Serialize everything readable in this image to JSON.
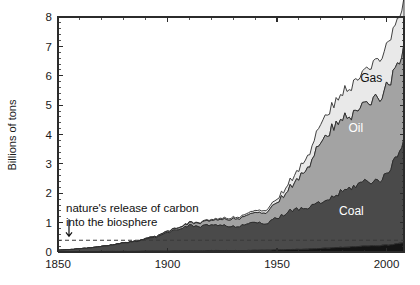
{
  "chart_data": {
    "type": "area",
    "stacked": true,
    "title": "",
    "subtitle": "",
    "xlabel": "",
    "ylabel": "Billions of tons",
    "xlim": [
      1850,
      2008
    ],
    "ylim": [
      0,
      8
    ],
    "grid": false,
    "legend_position": "inline-labels",
    "x_ticks_major": [
      1850,
      1900,
      1950,
      2000
    ],
    "x_tick_labels": [
      "1850",
      "1900",
      "1950",
      "2000"
    ],
    "x_tick_minor_step": 10,
    "y_ticks_major": [
      0,
      1,
      2,
      3,
      4,
      5,
      6,
      7,
      8
    ],
    "y_tick_labels": [
      "0",
      "1",
      "2",
      "3",
      "4",
      "5",
      "6",
      "7",
      "8"
    ],
    "y_tick_minor_step": 0.2,
    "colors": {
      "other": "#141414",
      "coal": "#4a4a4a",
      "oil": "#a3a3a3",
      "gas": "#e9e9e9",
      "outline": "#2b2b2b",
      "axis": "#2b2b2b",
      "nature_line": "#3a3a3a",
      "background": "#ffffff"
    },
    "x": [
      1850,
      1855,
      1860,
      1865,
      1870,
      1875,
      1880,
      1885,
      1890,
      1895,
      1900,
      1905,
      1910,
      1915,
      1920,
      1925,
      1930,
      1935,
      1940,
      1945,
      1950,
      1955,
      1960,
      1965,
      1970,
      1975,
      1980,
      1985,
      1990,
      1995,
      2000,
      2005,
      2008
    ],
    "series": [
      {
        "name": "Other",
        "label": "",
        "color": "#141414",
        "values": [
          0.01,
          0.01,
          0.01,
          0.01,
          0.02,
          0.02,
          0.02,
          0.02,
          0.03,
          0.03,
          0.03,
          0.04,
          0.04,
          0.04,
          0.05,
          0.05,
          0.05,
          0.05,
          0.06,
          0.06,
          0.07,
          0.08,
          0.09,
          0.1,
          0.12,
          0.14,
          0.16,
          0.18,
          0.2,
          0.21,
          0.23,
          0.28,
          0.32
        ]
      },
      {
        "name": "Coal",
        "label": "Coal",
        "color": "#4a4a4a",
        "values": [
          0.05,
          0.07,
          0.1,
          0.13,
          0.17,
          0.22,
          0.28,
          0.33,
          0.42,
          0.48,
          0.62,
          0.75,
          0.85,
          0.82,
          0.87,
          0.85,
          0.8,
          0.85,
          1.0,
          0.88,
          1.08,
          1.3,
          1.35,
          1.42,
          1.55,
          1.7,
          1.9,
          2.05,
          2.2,
          2.2,
          2.35,
          3.1,
          3.5
        ]
      },
      {
        "name": "Oil",
        "label": "Oil",
        "color": "#a3a3a3",
        "values": [
          0.0,
          0.0,
          0.0,
          0.0,
          0.0,
          0.0,
          0.01,
          0.01,
          0.02,
          0.03,
          0.04,
          0.06,
          0.09,
          0.12,
          0.16,
          0.2,
          0.26,
          0.28,
          0.33,
          0.38,
          0.52,
          0.75,
          1.05,
          1.45,
          2.1,
          2.35,
          2.55,
          2.45,
          2.7,
          2.8,
          2.95,
          3.05,
          3.1
        ]
      },
      {
        "name": "Gas",
        "label": "Gas",
        "color": "#e9e9e9",
        "values": [
          0.0,
          0.0,
          0.0,
          0.0,
          0.0,
          0.0,
          0.0,
          0.0,
          0.0,
          0.0,
          0.01,
          0.01,
          0.02,
          0.02,
          0.03,
          0.04,
          0.05,
          0.06,
          0.07,
          0.09,
          0.12,
          0.2,
          0.3,
          0.42,
          0.62,
          0.75,
          0.9,
          1.0,
          1.15,
          1.25,
          1.4,
          1.55,
          1.6
        ]
      }
    ],
    "totals_note": "Stacked total reaches about 8 billion tons by 2008",
    "reference_line": {
      "name": "nature's release of carbon into the biosphere",
      "value": 0.4,
      "style": "dashed",
      "annotation_lines": [
        "nature's release of carbon",
        "into the biosphere"
      ],
      "arrow": "down"
    },
    "series_labels": [
      {
        "text": "Gas",
        "x": 1993,
        "y": 5.8
      },
      {
        "text": "Oil",
        "x": 1986,
        "y": 4.1
      },
      {
        "text": "Coal",
        "x": 1984,
        "y": 1.25
      }
    ]
  }
}
